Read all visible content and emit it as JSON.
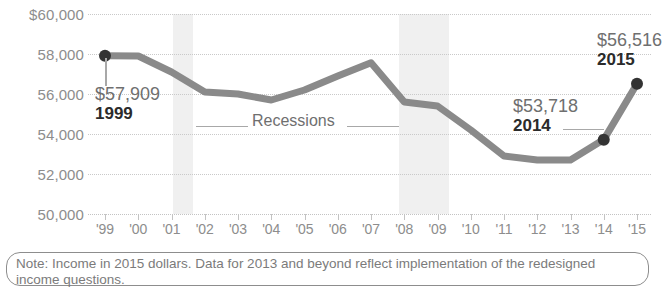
{
  "chart_data": {
    "type": "line",
    "title": "",
    "xlabel": "",
    "ylabel": "",
    "x": [
      1999,
      2000,
      2001,
      2002,
      2003,
      2004,
      2005,
      2006,
      2007,
      2008,
      2009,
      2010,
      2011,
      2012,
      2013,
      2014,
      2015
    ],
    "tick_labels": [
      "'99",
      "'00",
      "'01",
      "'02",
      "'03",
      "'04",
      "'05",
      "'06",
      "'07",
      "'08",
      "'09",
      "'10",
      "'11",
      "'12",
      "'13",
      "'14",
      "'15"
    ],
    "values": [
      57909,
      57900,
      57100,
      56100,
      56000,
      55700,
      56200,
      56900,
      57560,
      55600,
      55400,
      54200,
      52900,
      52700,
      52700,
      53718,
      56516
    ],
    "ylim": [
      50000,
      60000
    ],
    "ytick_values": [
      60000,
      58000,
      56000,
      54000,
      52000,
      50000
    ],
    "ytick_labels": [
      "$60,000",
      "58,000",
      "56,000",
      "54,000",
      "52,000",
      "50,000"
    ],
    "grid": true,
    "legend": "none",
    "line_color": "#8a8a8a",
    "marker_color": "#333333",
    "band_color": "#f0f0f0",
    "markers": [
      {
        "x": 1999,
        "y": 57909
      },
      {
        "x": 2014,
        "y": 53718
      },
      {
        "x": 2015,
        "y": 56516
      }
    ],
    "shaded_regions": [
      {
        "label": "recession",
        "x_start": 2001.6,
        "x_end": 2002.2
      },
      {
        "label": "recession",
        "x_start": 2008.5,
        "x_end": 2010.0
      }
    ],
    "annotations": [
      {
        "id": "1999",
        "value_label": "$57,909",
        "year_label": "1999"
      },
      {
        "id": "2014",
        "value_label": "$53,718",
        "year_label": "2014"
      },
      {
        "id": "2015",
        "value_label": "$56,516",
        "year_label": "2015"
      },
      {
        "id": "recessions",
        "text": "Recessions"
      }
    ]
  },
  "note": {
    "text": "Note: Income in 2015 dollars. Data for 2013 and beyond reflect implementation of the redesigned income questions."
  }
}
